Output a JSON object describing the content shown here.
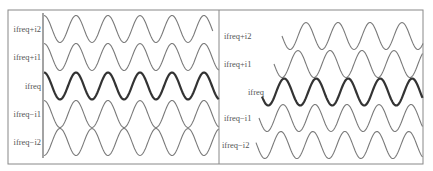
{
  "figure": {
    "frame": {
      "x": 8,
      "y": 10,
      "width": 415,
      "height": 154,
      "divider_x": 219,
      "stroke": "#888888"
    },
    "panels": [
      {
        "id": "left",
        "axis_x": 43,
        "axis_y_top": 13,
        "axis_y_bottom": 158,
        "period": 32,
        "amplitude": 13.5,
        "rows": [
          {
            "label": "ifreq+i2",
            "center_y": 29,
            "x_start": 44,
            "x_end": 213,
            "phase_deg": 90,
            "bold": false,
            "label_x": 41
          },
          {
            "label": "ifreq+i1",
            "center_y": 57,
            "x_start": 44,
            "x_end": 219,
            "phase_deg": 90,
            "bold": false,
            "label_x": 41
          },
          {
            "label": "ifreq",
            "center_y": 86,
            "x_start": 44,
            "x_end": 219,
            "phase_deg": 90,
            "bold": true,
            "label_x": 41
          },
          {
            "label": "ifreq−i1",
            "center_y": 114,
            "x_start": 44,
            "x_end": 219,
            "phase_deg": 90,
            "bold": false,
            "label_x": 41
          },
          {
            "label": "ifreq−i2",
            "center_y": 142,
            "x_start": 44,
            "x_end": 219,
            "phase_deg": 270,
            "bold": false,
            "label_x": 41
          }
        ]
      },
      {
        "id": "right",
        "axis_x": null,
        "period": 32,
        "amplitude": 13.5,
        "rows": [
          {
            "label": "ifreq+i2",
            "center_y": 36,
            "x_start": 282,
            "x_end": 423,
            "phase_deg": 180,
            "bold": false,
            "label_x": 224,
            "anchor": "start"
          },
          {
            "label": "ifreq+i1",
            "center_y": 64,
            "x_start": 274,
            "x_end": 423,
            "phase_deg": 180,
            "bold": false,
            "label_x": 224,
            "anchor": "start"
          },
          {
            "label": "ifreq",
            "center_y": 92,
            "x_start": 262,
            "x_end": 423,
            "phase_deg": 200,
            "bold": true,
            "label_x": 248,
            "anchor": "start"
          },
          {
            "label": "ifreq−i1",
            "center_y": 118,
            "x_start": 259,
            "x_end": 423,
            "phase_deg": 180,
            "bold": false,
            "label_x": 224,
            "anchor": "start"
          },
          {
            "label": "ifreq−i2",
            "center_y": 145,
            "x_start": 256,
            "x_end": 423,
            "phase_deg": 170,
            "bold": false,
            "label_x": 222,
            "anchor": "start"
          }
        ]
      }
    ],
    "colors": {
      "wave": "#7a7a7a",
      "wave_bold": "#333333",
      "label": "#555555",
      "axis": "#666666"
    }
  }
}
